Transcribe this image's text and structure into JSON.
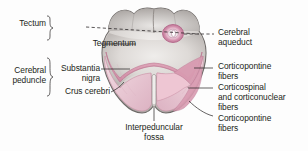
{
  "figure": {
    "colors": {
      "outline": "#6e6a68",
      "tissue_light": "#e8e6e4",
      "tissue_mid": "#cfcbc8",
      "tissue_dark": "#a9a4a1",
      "pink_light": "#f2d3dc",
      "pink_mid": "#e3a8bb",
      "pink_dark": "#c9748f",
      "aqueduct_ring": "#c9749a",
      "label_text": "#231f20"
    }
  },
  "labels": {
    "left": [
      {
        "id": "tectum",
        "text": "Tectum"
      },
      {
        "id": "tegmentum",
        "text": "Tegmentum"
      },
      {
        "id": "cerebral-peduncle",
        "text_line1": "Cerebral",
        "text_line2": "peduncle"
      },
      {
        "id": "substantia-nigra",
        "text_line1": "Substantia",
        "text_line2": "nigra"
      },
      {
        "id": "crus-cerebri",
        "text": "Crus cerebri"
      }
    ],
    "right": [
      {
        "id": "cerebral-aqueduct",
        "text_line1": "Cerebral",
        "text_line2": "aqueduct"
      },
      {
        "id": "corticopontine-fibers-upper",
        "text_line1": "Corticopontine",
        "text_line2": "fibers"
      },
      {
        "id": "corticospinal-corticonuclear-fibers",
        "text_line1": "Corticospinal",
        "text_line2": "and corticonuclear",
        "text_line3": "fibers"
      },
      {
        "id": "corticopontine-fibers-lower",
        "text_line1": "Corticopontine",
        "text_line2": "fibers"
      }
    ],
    "bottom": [
      {
        "id": "interpeduncular-fossa",
        "text_line1": "Interpeduncular",
        "text_line2": "fossa"
      }
    ]
  }
}
